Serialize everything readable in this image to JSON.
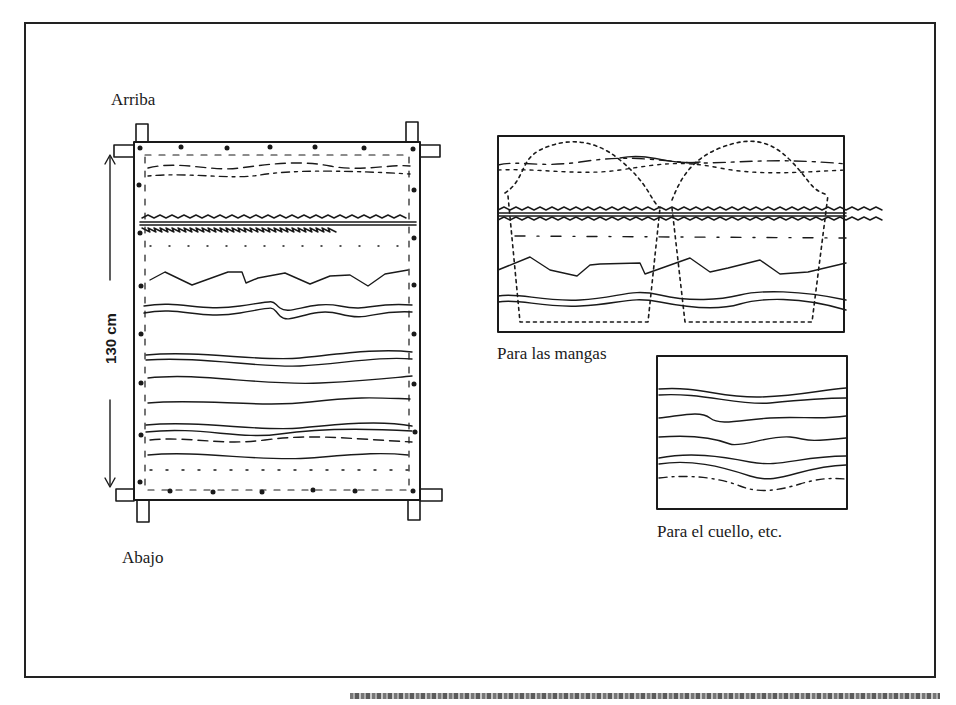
{
  "labels": {
    "top": "Arriba",
    "bottom": "Abajo",
    "dimension": "130 cm",
    "sleeves": "Para las mangas",
    "collar": "Para el cuello, etc."
  },
  "colors": {
    "ink": "#1a1a1a",
    "paper": "#ffffff"
  },
  "diagram": {
    "main_panel": {
      "description": "Fabric stretched on frame with pins, wavy lines indicating dye layers",
      "height_label": "130 cm"
    },
    "sleeve_panel": {
      "description": "Fabric with dotted sleeve pattern outlines (two)"
    },
    "collar_panel": {
      "description": "Smaller fabric piece with wavy lines"
    }
  }
}
